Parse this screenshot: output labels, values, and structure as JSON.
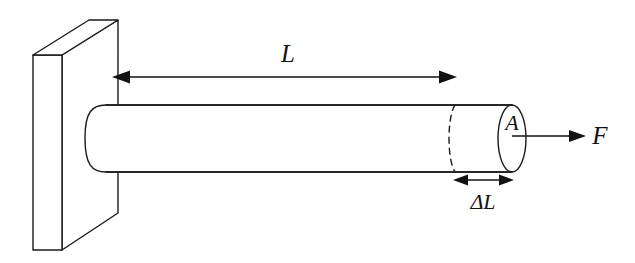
{
  "figure": {
    "type": "physics-diagram",
    "background_color": "#ffffff",
    "line_color": "#1a1a1a",
    "labels": {
      "length": "L",
      "area": "A",
      "force": "F",
      "elongation": "ΔL"
    },
    "annotations": [
      {
        "name": "length-dimension",
        "text": "L",
        "description": "double-headed horizontal dimension arrow spanning the original rod length from the wall face to the undeformed end"
      },
      {
        "name": "cross-section-area",
        "text": "A",
        "description": "label on the elliptical end face denoting the cross-sectional area of the rod"
      },
      {
        "name": "applied-force",
        "text": "F",
        "description": "single-headed arrow pointing right from the rod end face denoting the applied tensile force"
      },
      {
        "name": "elongation-dimension",
        "text": "ΔL",
        "description": "short double-headed arrow between the dashed original end position and the stretched end, denoting the extension"
      }
    ],
    "elements": {
      "wall": "fixed support slab drawn in oblique projection",
      "rod": "horizontal cylindrical rod embedded in the wall",
      "dashed_ellipse": "dashed arc marking the original (unstretched) rod end position",
      "end_face": "solid ellipse forming the stretched rod end face"
    }
  }
}
